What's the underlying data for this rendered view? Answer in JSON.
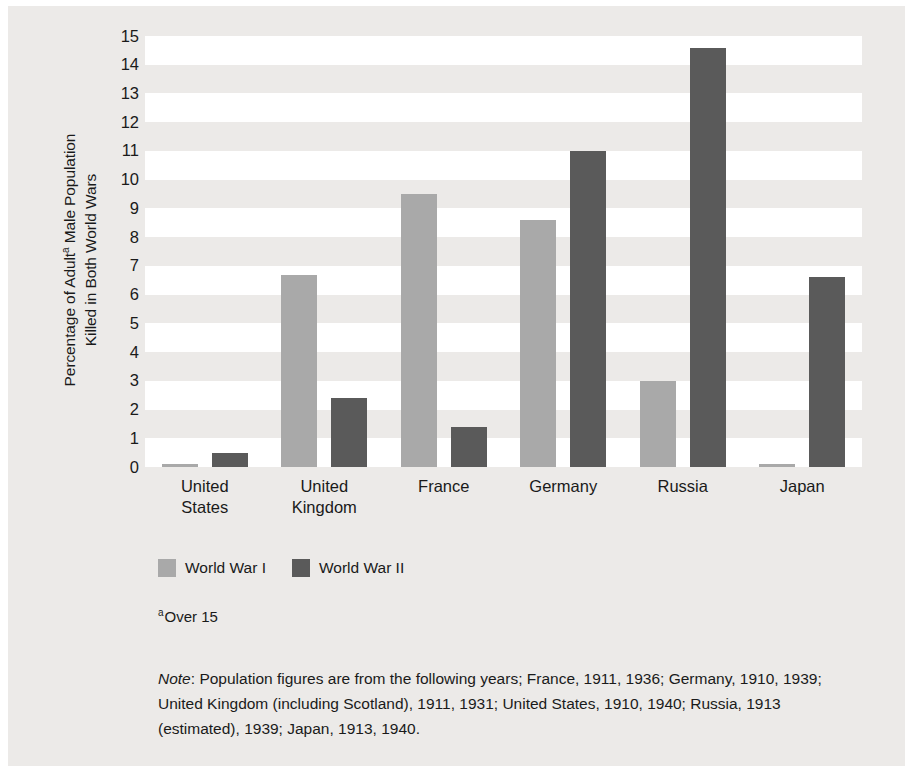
{
  "chart_data": {
    "type": "bar",
    "title": "",
    "xlabel": "",
    "ylabel": "Percentage of Adultᵃ Male Population Killed in Both World Wars",
    "ylabel_line1": "Percentage of Adult",
    "ylabel_line1_sup": "a",
    "ylabel_line1_rest": " Male Population",
    "ylabel_line2": "Killed in Both World Wars",
    "categories": [
      "United States",
      "United Kingdom",
      "France",
      "Germany",
      "Russia",
      "Japan"
    ],
    "category_lines": [
      [
        "United",
        "States"
      ],
      [
        "United",
        "Kingdom"
      ],
      [
        "France"
      ],
      [
        "Germany"
      ],
      [
        "Russia"
      ],
      [
        "Japan"
      ]
    ],
    "series": [
      {
        "name": "World War I",
        "color": "#a9a9a9",
        "values": [
          0.1,
          6.7,
          9.5,
          8.6,
          3.0,
          0.1
        ]
      },
      {
        "name": "World War II",
        "color": "#5a5a5a",
        "values": [
          0.5,
          2.4,
          1.4,
          11.0,
          14.6,
          6.6
        ]
      }
    ],
    "ylim": [
      0,
      15
    ],
    "ytick_values": [
      0,
      1,
      2,
      3,
      4,
      5,
      6,
      7,
      8,
      9,
      10,
      11,
      12,
      13,
      14,
      15
    ],
    "ytick_labels": [
      "0",
      "1",
      "2",
      "3",
      "4",
      "5",
      "6",
      "7",
      "8",
      "9",
      "10",
      "11",
      "12",
      "13",
      "14",
      "15"
    ],
    "grid": "alternating-horizontal-bands",
    "legend_position": "below-plot-left",
    "band_color_light": "#ffffff",
    "band_color_dark": "#eceae8",
    "panel_background": "#eceae8"
  },
  "legend": {
    "items": [
      {
        "label": "World War I",
        "swatch": "ww1"
      },
      {
        "label": "World War II",
        "swatch": "ww2"
      }
    ]
  },
  "footnote": {
    "marker": "a",
    "text": "Over 15"
  },
  "note": {
    "label": "Note",
    "separator": ": ",
    "text": "Population figures are from the following years; France, 1911, 1936; Germany, 1910, 1939; United Kingdom (including Scotland), 1911, 1931; United States, 1910, 1940; Russia, 1913 (estimated), 1939; Japan, 1913, 1940."
  }
}
